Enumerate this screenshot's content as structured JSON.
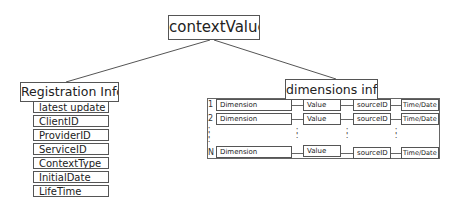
{
  "root": {
    "label": "contextValue"
  },
  "registration": {
    "title": "Registration Info",
    "items": [
      "latest update",
      "ClientID",
      "ProviderID",
      "ServiceID",
      "ContextType",
      "InitialDate",
      "LifeTime"
    ]
  },
  "dimensions": {
    "title": "dimensions info",
    "columns": [
      "Dimension",
      "Value",
      "sourceID",
      "Time/Date"
    ],
    "rows": [
      {
        "index": "1",
        "dimension": "Dimension",
        "value": "Value",
        "source": "sourceID",
        "time": "Time/Date"
      },
      {
        "index": "2",
        "dimension": "Dimension",
        "value": "Value",
        "source": "sourceID",
        "time": "Time/Date"
      },
      {
        "index": "N",
        "dimension": "Dimension",
        "value": "Value",
        "source": "sourceID",
        "time": "Time/Date"
      }
    ],
    "ellipsis": ":"
  }
}
